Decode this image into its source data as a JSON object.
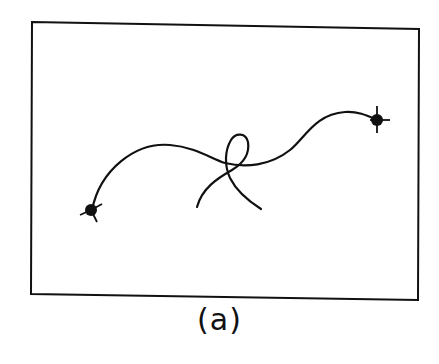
{
  "figure": {
    "caption": "(a)",
    "colors": {
      "stroke": "#111111",
      "background": "#ffffff"
    },
    "elements": [
      {
        "type": "frame",
        "label": "rectangular boundary"
      },
      {
        "type": "curve",
        "label": "main curve connecting two endpoints"
      },
      {
        "type": "curve",
        "label": "secondary curve forming a loop"
      },
      {
        "type": "endpoint",
        "label": "left endpoint marker"
      },
      {
        "type": "endpoint",
        "label": "right endpoint marker"
      }
    ]
  }
}
